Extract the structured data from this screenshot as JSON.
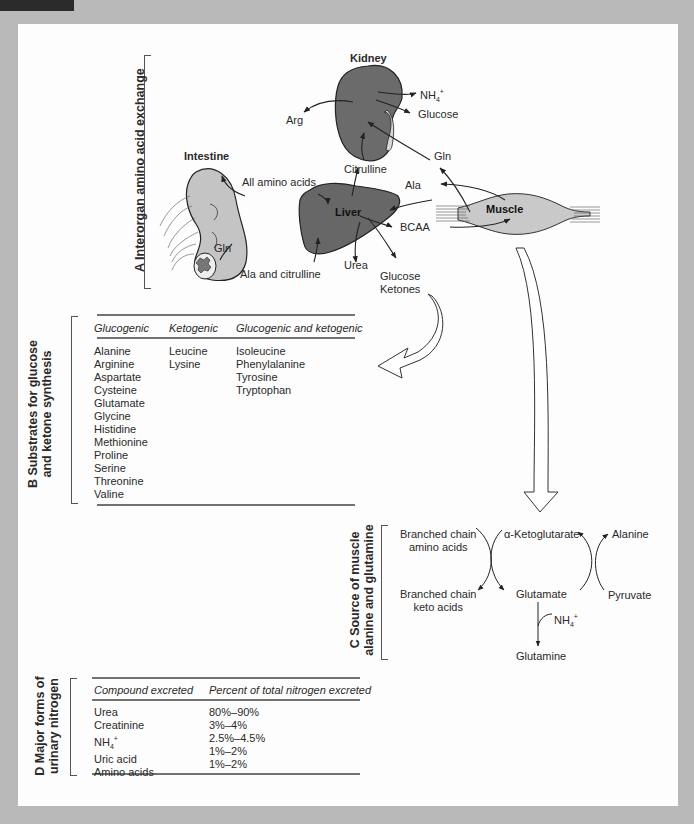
{
  "sections": {
    "A": {
      "label": "A  Interorgan amino acid exchange",
      "organs": {
        "kidney": "Kidney",
        "intestine": "Intestine",
        "liver": "Liver",
        "muscle": "Muscle"
      },
      "labels": {
        "nh4": "NH",
        "nh4_sub": "4",
        "nh4_sup": "+",
        "glucose_kidney": "Glucose",
        "arg": "Arg",
        "gln_kidney": "Gln",
        "citrulline": "Citrulline",
        "all_amino_acids": "All amino acids",
        "ala": "Ala",
        "bcaa": "BCAA",
        "gln_intestine": "Gln",
        "ala_and_citrulline": "Ala and citrulline",
        "urea": "Urea",
        "glucose_liver": "Glucose",
        "ketones": "Ketones"
      }
    },
    "B": {
      "label_line1": "B  Substrates for glucose",
      "label_line2": "and ketone synthesis",
      "headers": [
        "Glucogenic",
        "Ketogenic",
        "Glucogenic and ketogenic"
      ],
      "glucogenic": [
        "Alanine",
        "Arginine",
        "Aspartate",
        "Cysteine",
        "Glutamate",
        "Glycine",
        "Histidine",
        "Methionine",
        "Proline",
        "Serine",
        "Threonine",
        "Valine"
      ],
      "ketogenic": [
        "Leucine",
        "Lysine"
      ],
      "both": [
        "Isoleucine",
        "Phenylalanine",
        "Tyrosine",
        "Tryptophan"
      ]
    },
    "C": {
      "label_line1": "C  Source of muscle",
      "label_line2": "alanine and glutamine",
      "bcaa_line1": "Branched chain",
      "bcaa_line2": "amino acids",
      "bcka_line1": "Branched chain",
      "bcka_line2": "keto acids",
      "akg": "α-Ketoglutarate",
      "glutamate": "Glutamate",
      "alanine": "Alanine",
      "pyruvate": "Pyruvate",
      "nh4": "NH",
      "nh4_sub": "4",
      "nh4_sup": "+",
      "glutamine": "Glutamine"
    },
    "D": {
      "label_line1": "D  Major forms of",
      "label_line2": "urinary nitrogen",
      "headers": [
        "Compound excreted",
        "Percent of total nitrogen excreted"
      ],
      "rows": [
        {
          "compound": "Urea",
          "percent": "80%–90%"
        },
        {
          "compound": "Creatinine",
          "percent": "3%–4%"
        },
        {
          "compound": "NH",
          "compound_sub": "4",
          "compound_sup": "+",
          "percent": "2.5%–4.5%"
        },
        {
          "compound": "Uric acid",
          "percent": "1%–2%"
        },
        {
          "compound": "Amino acids",
          "percent": "1%–2%"
        }
      ]
    }
  },
  "colors": {
    "background": "#b9b9b9",
    "panel": "#fdfdfd",
    "organ_dark": "#6b6b6b",
    "organ_light": "#c8c8c8",
    "line": "#333333"
  }
}
